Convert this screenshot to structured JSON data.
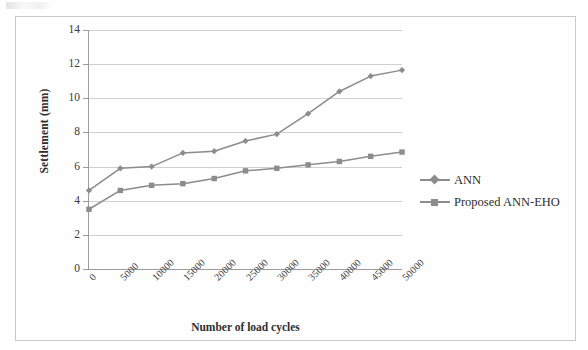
{
  "figure": {
    "scan_artifact_name": "scan-smudge"
  },
  "chart_data": {
    "type": "line",
    "title": "",
    "xlabel": "Number of load cycles",
    "ylabel": "Settlement (mm)",
    "categories": [
      "0",
      "5000",
      "10000",
      "15000",
      "20000",
      "25000",
      "30000",
      "35000",
      "40000",
      "45000",
      "50000"
    ],
    "ylim": [
      0,
      14
    ],
    "ytick_step": 2,
    "yticks": [
      "14",
      "12",
      "10",
      "8",
      "6",
      "4",
      "2",
      "0"
    ],
    "grid": true,
    "legend_position": "right",
    "series": [
      {
        "name": "ANN",
        "marker": "diamond",
        "color": "#8c8c8c",
        "values": [
          4.6,
          5.9,
          6.0,
          6.8,
          6.9,
          7.5,
          7.9,
          9.1,
          10.4,
          11.3,
          11.65
        ]
      },
      {
        "name": "Proposed ANN-EHO",
        "marker": "square",
        "color": "#8c8c8c",
        "values": [
          3.5,
          4.6,
          4.9,
          5.0,
          5.3,
          5.75,
          5.9,
          6.1,
          6.3,
          6.6,
          6.85
        ]
      }
    ]
  },
  "legend": {
    "entries": [
      {
        "label": "ANN",
        "marker": "diamond"
      },
      {
        "label": "Proposed ANN-EHO",
        "marker": "square"
      }
    ]
  },
  "colors": {
    "series": "#8c8c8c",
    "gridline": "#d0d0d0",
    "axis": "#9b9b9b",
    "text": "#2e2e2e",
    "frame": "#c9c9c9"
  }
}
